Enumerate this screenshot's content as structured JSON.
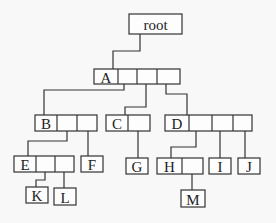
{
  "diagram": {
    "nodes": [
      {
        "id": "root",
        "label": "root",
        "x": 129,
        "y": 14,
        "w": 53,
        "h": 20,
        "cells": []
      },
      {
        "id": "A",
        "label": "A",
        "x": 94,
        "y": 69,
        "w": 24,
        "h": 15,
        "cells": [
          19,
          20,
          23
        ]
      },
      {
        "id": "B",
        "label": "B",
        "x": 35,
        "y": 115,
        "w": 22,
        "h": 16,
        "cells": [
          20,
          20
        ]
      },
      {
        "id": "C",
        "label": "C",
        "x": 106,
        "y": 115,
        "w": 22,
        "h": 16,
        "cells": [
          22
        ]
      },
      {
        "id": "D",
        "label": "D",
        "x": 165,
        "y": 115,
        "w": 24,
        "h": 16,
        "cells": [
          23,
          21,
          19
        ]
      },
      {
        "id": "E",
        "label": "E",
        "x": 14,
        "y": 156,
        "w": 22,
        "h": 16,
        "cells": [
          19,
          19
        ]
      },
      {
        "id": "F",
        "label": "F",
        "x": 81,
        "y": 156,
        "w": 22,
        "h": 16,
        "cells": []
      },
      {
        "id": "G",
        "label": "G",
        "x": 126,
        "y": 158,
        "w": 22,
        "h": 16,
        "cells": []
      },
      {
        "id": "H",
        "label": "H",
        "x": 157,
        "y": 158,
        "w": 25,
        "h": 16,
        "cells": [
          21
        ]
      },
      {
        "id": "I",
        "label": "I",
        "x": 209,
        "y": 158,
        "w": 22,
        "h": 16,
        "cells": []
      },
      {
        "id": "J",
        "label": "J",
        "x": 238,
        "y": 158,
        "w": 22,
        "h": 16,
        "cells": []
      },
      {
        "id": "K",
        "label": "K",
        "x": 26,
        "y": 187,
        "w": 22,
        "h": 16,
        "cells": []
      },
      {
        "id": "L",
        "label": "L",
        "x": 54,
        "y": 188,
        "w": 22,
        "h": 17,
        "cells": []
      },
      {
        "id": "M",
        "label": "M",
        "x": 181,
        "y": 190,
        "w": 24,
        "h": 17,
        "cells": []
      }
    ],
    "edges": [
      {
        "from": "root",
        "to": "A",
        "points": [
          [
            140,
            34
          ],
          [
            140,
            51
          ],
          [
            113,
            51
          ],
          [
            113,
            69
          ]
        ]
      },
      {
        "from": "A",
        "to": "B",
        "points": [
          [
            124,
            84
          ],
          [
            124,
            90
          ],
          [
            44,
            90
          ],
          [
            44,
            115
          ]
        ]
      },
      {
        "from": "A",
        "to": "C",
        "points": [
          [
            146,
            84
          ],
          [
            146,
            107
          ],
          [
            125,
            107
          ],
          [
            125,
            115
          ]
        ]
      },
      {
        "from": "A",
        "to": "D",
        "points": [
          [
            166,
            84
          ],
          [
            166,
            94
          ],
          [
            187,
            94
          ],
          [
            187,
            115
          ]
        ]
      },
      {
        "from": "B",
        "to": "E",
        "points": [
          [
            67,
            131
          ],
          [
            67,
            141
          ],
          [
            28,
            141
          ],
          [
            28,
            156
          ]
        ]
      },
      {
        "from": "B",
        "to": "F",
        "points": [
          [
            88,
            131
          ],
          [
            88,
            156
          ]
        ]
      },
      {
        "from": "C",
        "to": "G",
        "points": [
          [
            138,
            131
          ],
          [
            138,
            158
          ]
        ]
      },
      {
        "from": "D",
        "to": "H",
        "points": [
          [
            196,
            131
          ],
          [
            196,
            147
          ],
          [
            171,
            147
          ],
          [
            171,
            158
          ]
        ]
      },
      {
        "from": "D",
        "to": "I",
        "points": [
          [
            220,
            131
          ],
          [
            220,
            158
          ]
        ]
      },
      {
        "from": "D",
        "to": "J",
        "points": [
          [
            245,
            131
          ],
          [
            245,
            158
          ]
        ]
      },
      {
        "from": "E",
        "to": "K",
        "points": [
          [
            45,
            172
          ],
          [
            45,
            180
          ],
          [
            36,
            180
          ],
          [
            36,
            187
          ]
        ]
      },
      {
        "from": "E",
        "to": "L",
        "points": [
          [
            64,
            172
          ],
          [
            64,
            188
          ]
        ]
      },
      {
        "from": "H",
        "to": "M",
        "points": [
          [
            192,
            174
          ],
          [
            192,
            190
          ]
        ]
      }
    ]
  }
}
